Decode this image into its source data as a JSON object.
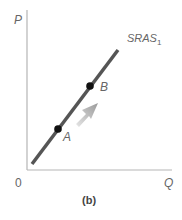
{
  "diagram": {
    "axes": {
      "y_label": "P",
      "x_label": "Q",
      "origin_label": "0"
    },
    "curve": {
      "name": "SRAS",
      "subscript": "1",
      "color": "#555555"
    },
    "points": [
      {
        "label": "A"
      },
      {
        "label": "B"
      }
    ],
    "arrow": {
      "direction": "up-right",
      "description": "movement along curve from A to B",
      "color": "#aaaaaa"
    },
    "caption": "(b)"
  }
}
